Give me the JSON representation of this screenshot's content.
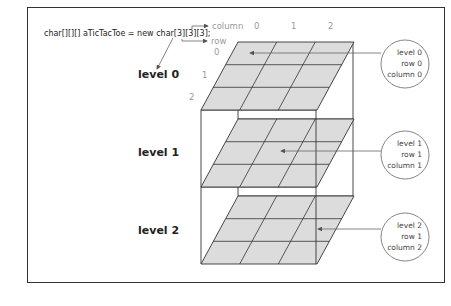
{
  "code_line": "char[][][] aTicTacToe = new char[3][3][3];",
  "axis_labels": {
    "column": "column",
    "row": "row",
    "column_indices": [
      "0",
      "1",
      "2"
    ],
    "row_indices": [
      "0",
      "1",
      "2"
    ]
  },
  "levels": [
    {
      "label": "level 0"
    },
    {
      "label": "level 1"
    },
    {
      "label": "level 2"
    }
  ],
  "callouts": [
    {
      "lines": [
        "level 0",
        "row 0",
        "column 0"
      ]
    },
    {
      "lines": [
        "level 1",
        "row 1",
        "column 1"
      ]
    },
    {
      "lines": [
        "level 2",
        "row 1",
        "column 2"
      ]
    }
  ],
  "colors": {
    "plane_fill": "#dcdcdc",
    "line": "#333333",
    "axis_text": "#9a9a9a"
  }
}
